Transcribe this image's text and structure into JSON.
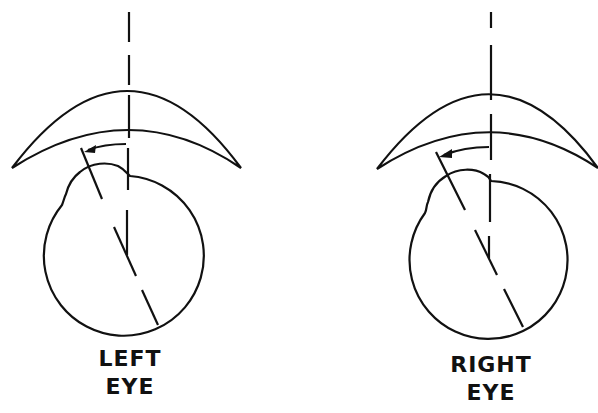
{
  "figure": {
    "panels": [
      {
        "id": "left",
        "label_line1": "LEFT",
        "label_line2": "EYE",
        "rotation_direction": "counterclockwise"
      },
      {
        "id": "right",
        "label_line1": "RIGHT",
        "label_line2": "EYE",
        "rotation_direction": "counterclockwise"
      }
    ],
    "stroke_color": "#111111",
    "background_color": "#ffffff"
  }
}
